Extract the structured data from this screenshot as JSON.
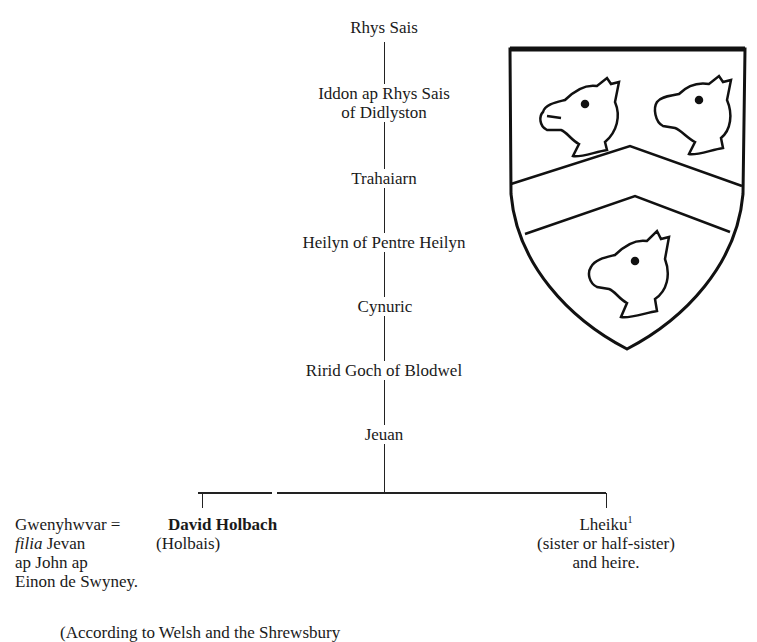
{
  "pedigree": {
    "generations": [
      {
        "name": "Rhys Sais"
      },
      {
        "name": "Iddon ap Rhys Sais",
        "line2": "of Didlyston"
      },
      {
        "name": "Trahaiarn"
      },
      {
        "name": "Heilyn of Pentre Heilyn"
      },
      {
        "name": "Cynuric"
      },
      {
        "name": "Ririd Goch of Blodwel"
      },
      {
        "name": "Jeuan"
      }
    ],
    "spouse": {
      "name": "Gwenyhwvar",
      "marriage_sign": "=",
      "line2_italic": "filia",
      "line2_rest": " Jevan",
      "line3": "ap John ap",
      "line4": "Einon de Swyney."
    },
    "son": {
      "name": "David Holbach",
      "alias": "(Holbais)"
    },
    "daughter": {
      "name": "Lheiku",
      "footnote": "1",
      "line2": "(sister or half-sister)",
      "line3": "and heire."
    },
    "source_note": "(According to Welsh and the Shrewsbury"
  },
  "coat_of_arms": {
    "description": "Shield with a chevron between three boars' heads couped",
    "charges": [
      "boar-head",
      "boar-head",
      "boar-head"
    ],
    "ordinary": "chevron"
  }
}
